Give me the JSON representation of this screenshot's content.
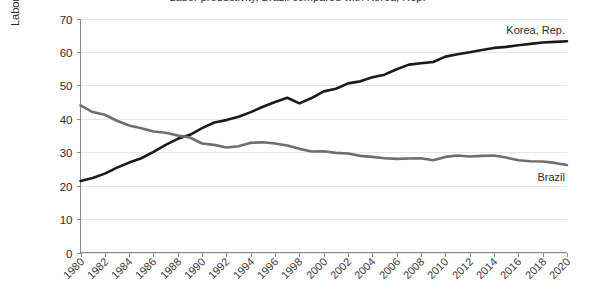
{
  "chart_data": {
    "type": "line",
    "title": "Labor productivity, Brazil compared with Korea, Rep.",
    "xlabel": "",
    "ylabel": "Labor productivity (GDP per person employed relative to a US worker, %)",
    "xlim": [
      1980,
      2020
    ],
    "ylim": [
      0,
      70
    ],
    "yticks": [
      0,
      10,
      20,
      30,
      40,
      50,
      60,
      70
    ],
    "xticks": [
      1980,
      1982,
      1984,
      1986,
      1988,
      1990,
      1992,
      1994,
      1996,
      1998,
      2000,
      2002,
      2004,
      2006,
      2008,
      2010,
      2012,
      2014,
      2016,
      2018,
      2020
    ],
    "grid": true,
    "legend_position": "inline-right-end",
    "x": [
      1980,
      1981,
      1982,
      1983,
      1984,
      1985,
      1986,
      1987,
      1988,
      1989,
      1990,
      1991,
      1992,
      1993,
      1994,
      1995,
      1996,
      1997,
      1998,
      1999,
      2000,
      2001,
      2002,
      2003,
      2004,
      2005,
      2006,
      2007,
      2008,
      2009,
      2010,
      2011,
      2012,
      2013,
      2014,
      2015,
      2016,
      2017,
      2018,
      2019,
      2020
    ],
    "series": [
      {
        "name": "Korea, Rep.",
        "color": "#1a1a1a",
        "label_anchor_year": 2016,
        "values": [
          21.4,
          22.3,
          23.6,
          25.4,
          26.9,
          28.2,
          30.1,
          32.2,
          34.0,
          35.2,
          37.2,
          38.9,
          39.6,
          40.6,
          42.0,
          43.6,
          45.0,
          46.3,
          44.6,
          46.2,
          48.2,
          49.0,
          50.6,
          51.2,
          52.4,
          53.2,
          54.8,
          56.2,
          56.6,
          57.0,
          58.6,
          59.3,
          59.9,
          60.6,
          61.2,
          61.5,
          62.0,
          62.4,
          62.8,
          63.0,
          63.2
        ]
      },
      {
        "name": "Brazil",
        "color": "#6e6e6e",
        "label_anchor_year": 2017,
        "values": [
          44.0,
          42.0,
          41.2,
          39.4,
          38.0,
          37.2,
          36.2,
          35.8,
          35.0,
          34.4,
          32.6,
          32.2,
          31.4,
          31.8,
          32.8,
          33.0,
          32.6,
          32.0,
          31.0,
          30.2,
          30.3,
          29.8,
          29.6,
          28.9,
          28.6,
          28.2,
          28.0,
          28.1,
          28.2,
          27.6,
          28.6,
          29.0,
          28.7,
          28.9,
          29.0,
          28.4,
          27.6,
          27.3,
          27.2,
          26.8,
          26.2
        ]
      }
    ]
  }
}
